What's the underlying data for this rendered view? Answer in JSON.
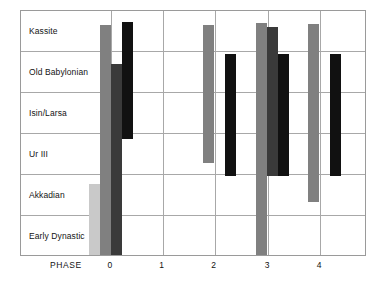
{
  "chart_data": {
    "type": "bar",
    "title": "",
    "subtitle": "",
    "xlabel": "PHASE",
    "ylabel": "",
    "orientation": "vertical-ranges",
    "grid": true,
    "legend_position": "none",
    "x": [
      "0",
      "1",
      "2",
      "3",
      "4"
    ],
    "categories": [
      "Early Dynastic",
      "Akkadian",
      "Ur III",
      "Isin/Larsa",
      "Old Babylonian",
      "Kassite"
    ],
    "y_band_labels_bottom_to_top": [
      "Early Dynastic",
      "Akkadian",
      "Ur III",
      "Isin/Larsa",
      "Old Babylonian",
      "Kassite"
    ],
    "ylim": [
      0,
      6
    ],
    "note": "Floating range bars: each bar spans from a start period to an end period on the vertical period axis. Values given in band units where 0 = bottom of Early Dynastic band and 6 = top of Kassite band.",
    "series": [
      {
        "name": "series-1",
        "color": "#c9c9c9",
        "bars": [
          {
            "phase": "0",
            "start": 0.0,
            "end": 1.75
          }
        ]
      },
      {
        "name": "series-2",
        "color": "#808080",
        "bars": [
          {
            "phase": "0",
            "start": 0.0,
            "end": 5.65
          },
          {
            "phase": "2",
            "start": 2.25,
            "end": 5.65
          },
          {
            "phase": "3",
            "start": 0.0,
            "end": 5.7
          },
          {
            "phase": "4",
            "start": 1.3,
            "end": 5.68
          }
        ]
      },
      {
        "name": "series-3",
        "color": "#3a3a3a",
        "bars": [
          {
            "phase": "0",
            "start": 0.0,
            "end": 4.7
          },
          {
            "phase": "3",
            "start": 1.95,
            "end": 5.6
          }
        ]
      },
      {
        "name": "series-4",
        "color": "#111111",
        "bars": [
          {
            "phase": "0",
            "start": 2.85,
            "end": 5.72
          },
          {
            "phase": "2",
            "start": 1.95,
            "end": 4.95
          },
          {
            "phase": "3",
            "start": 1.95,
            "end": 4.95
          },
          {
            "phase": "4",
            "start": 1.95,
            "end": 4.95
          }
        ]
      }
    ]
  },
  "axis": {
    "phase_caption": "PHASE",
    "ticks": [
      {
        "label": "0",
        "pos_pct": 26.0
      },
      {
        "label": "1",
        "pos_pct": 41.0
      },
      {
        "label": "2",
        "pos_pct": 56.0
      },
      {
        "label": "3",
        "pos_pct": 71.5
      },
      {
        "label": "4",
        "pos_pct": 86.5
      }
    ]
  },
  "bands": [
    {
      "label": "Kassite"
    },
    {
      "label": "Old Babylonian"
    },
    {
      "label": "Isin/Larsa"
    },
    {
      "label": "Ur III"
    },
    {
      "label": "Akkadian"
    },
    {
      "label": "Early Dynastic"
    }
  ],
  "colors": {
    "frame": "#9a9a9a",
    "grid": "#a8a8a8",
    "text": "#141414",
    "bar_light": "#c9c9c9",
    "bar_medium": "#808080",
    "bar_dark": "#3a3a3a",
    "bar_black": "#111111",
    "background": "#ffffff"
  }
}
